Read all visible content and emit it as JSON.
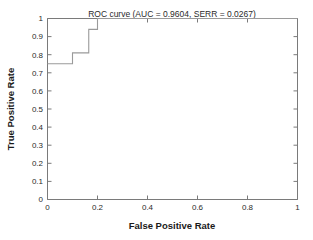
{
  "chart_data": {
    "type": "line",
    "title": "ROC curve (AUC = 0.9604, SERR = 0.0267)",
    "xlabel": "False Positive Rate",
    "ylabel": "True Positive Rate",
    "xlim": [
      0,
      1
    ],
    "ylim": [
      0,
      1
    ],
    "grid": false,
    "legend": null,
    "xticks": [
      "0",
      "0.2",
      "0.4",
      "0.6",
      "0.8",
      "1"
    ],
    "xtick_values": [
      0,
      0.2,
      0.4,
      0.6,
      0.8,
      1
    ],
    "yticks": [
      "0",
      "0.1",
      "0.2",
      "0.3",
      "0.4",
      "0.5",
      "0.6",
      "0.7",
      "0.8",
      "0.9",
      "1"
    ],
    "ytick_values": [
      0,
      0.1,
      0.2,
      0.3,
      0.4,
      0.5,
      0.6,
      0.7,
      0.8,
      0.9,
      1
    ],
    "series": [
      {
        "name": "ROC curve",
        "color": "#9a9a9a",
        "x": [
          0,
          0.1,
          0.1,
          0.165,
          0.165,
          0.2,
          0.2,
          1
        ],
        "y": [
          0.75,
          0.75,
          0.81,
          0.81,
          0.94,
          0.94,
          1,
          1
        ]
      }
    ],
    "annotations": {
      "auc": "0.9604",
      "serr": "0.0267"
    }
  },
  "figure": {
    "background_color": "#ffffff",
    "axis_color": "#7a7a7a",
    "text_color": "#2b2b2b"
  }
}
